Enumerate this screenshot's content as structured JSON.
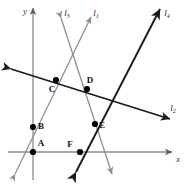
{
  "figure": {
    "width": 190,
    "height": 184,
    "background": "#ffffff"
  },
  "colors": {
    "axis": "#8a8a8a",
    "light_line": "#8f8f8f",
    "dark_line": "#1a1a1a",
    "point_fill": "#000000",
    "label_text": "#111111"
  },
  "axes": {
    "x": {
      "label": "x",
      "start": {
        "x": 8,
        "y": 152
      },
      "end": {
        "x": 172,
        "y": 152
      },
      "label_pos": {
        "x": 176,
        "y": 162
      },
      "arrow": "right"
    },
    "y": {
      "label": "y",
      "start": {
        "x": 33,
        "y": 180
      },
      "end": {
        "x": 33,
        "y": 8
      },
      "label_pos": {
        "x": 23,
        "y": 14
      },
      "arrow": "up"
    },
    "origin": {
      "x": 33,
      "y": 152
    }
  },
  "lines": [
    {
      "id": "l1",
      "label": "l",
      "subscript": "1",
      "color": "#8f8f8f",
      "weight": 1.3,
      "arrows": "both",
      "label_pos": {
        "x": 96,
        "y": 16
      },
      "from": {
        "x": 15,
        "y": 174
      },
      "to": {
        "x": 91,
        "y": 17
      }
    },
    {
      "id": "l3",
      "label": "l",
      "subscript": "3",
      "color": "#8f8f8f",
      "weight": 1.3,
      "arrows": "both",
      "label_pos": {
        "x": 67,
        "y": 16
      },
      "from": {
        "x": 61,
        "y": 18
      },
      "to": {
        "x": 112,
        "y": 174
      }
    },
    {
      "id": "l2",
      "label": "l",
      "subscript": "2",
      "color": "#1a1a1a",
      "weight": 1.7,
      "arrows": "both",
      "label_pos": {
        "x": 173,
        "y": 111
      },
      "from": {
        "x": 11,
        "y": 69
      },
      "to": {
        "x": 170,
        "y": 119
      }
    },
    {
      "id": "l4",
      "label": "l",
      "subscript": "4",
      "color": "#1a1a1a",
      "weight": 1.9,
      "arrows": "both",
      "label_pos": {
        "x": 167,
        "y": 16
      },
      "from": {
        "x": 76,
        "y": 172
      },
      "to": {
        "x": 160,
        "y": 9
      }
    }
  ],
  "points": [
    {
      "id": "A",
      "label": "A",
      "x": 33,
      "y": 152,
      "label_x": 41,
      "label_y": 146,
      "radius": 3.1
    },
    {
      "id": "B",
      "label": "B",
      "x": 33,
      "y": 127,
      "label_x": 41,
      "label_y": 129,
      "radius": 3.1
    },
    {
      "id": "C",
      "label": "C",
      "x": 56,
      "y": 80,
      "label_x": 52,
      "label_y": 92,
      "radius": 3.1
    },
    {
      "id": "D",
      "label": "D",
      "x": 87,
      "y": 89,
      "label_x": 90,
      "label_y": 83,
      "radius": 3.1
    },
    {
      "id": "E",
      "label": "E",
      "x": 95,
      "y": 124,
      "label_x": 102,
      "label_y": 128,
      "radius": 3.1
    },
    {
      "id": "F",
      "label": "F",
      "x": 80,
      "y": 152,
      "label_x": 70,
      "label_y": 147,
      "radius": 3.1
    }
  ]
}
